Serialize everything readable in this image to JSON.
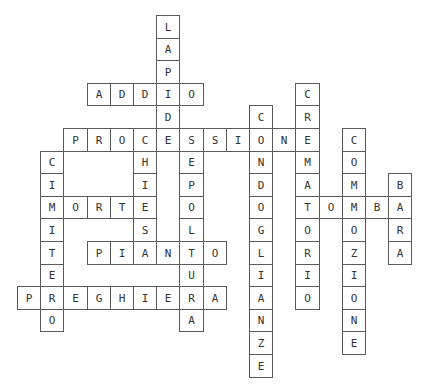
{
  "puzzle": {
    "type": "crossword",
    "grid": {
      "origin_x": 17,
      "origin_y": 15,
      "cell_w": 23.2,
      "cell_h": 22.6
    },
    "colors": {
      "border": "#5a5a5a",
      "text": "#333333",
      "background": "#ffffff"
    },
    "words": [
      {
        "word": "LAPIDE",
        "dir": "down",
        "col": 6,
        "row": 0
      },
      {
        "word": "ADDIO",
        "dir": "across",
        "col": 3,
        "row": 3
      },
      {
        "word": "CREMATORIO",
        "dir": "down",
        "col": 12,
        "row": 3
      },
      {
        "word": "CONDOGLIANZE",
        "dir": "down",
        "col": 10,
        "row": 4
      },
      {
        "word": "PROCESSIONE",
        "dir": "across",
        "col": 2,
        "row": 5
      },
      {
        "word": "CHIESA",
        "dir": "down",
        "col": 5,
        "row": 5
      },
      {
        "word": "SEPOLTURA",
        "dir": "down",
        "col": 7,
        "row": 5
      },
      {
        "word": "COMMOZIONE",
        "dir": "down",
        "col": 14,
        "row": 5
      },
      {
        "word": "CIMITERO",
        "dir": "down",
        "col": 1,
        "row": 6
      },
      {
        "word": "BARA",
        "dir": "down",
        "col": 16,
        "row": 7
      },
      {
        "word": "MORTE",
        "dir": "across",
        "col": 1,
        "row": 8
      },
      {
        "word": "TOMBA",
        "dir": "across",
        "col": 12,
        "row": 8
      },
      {
        "word": "PIANTO",
        "dir": "across",
        "col": 3,
        "row": 10
      },
      {
        "word": "PREGHIERA",
        "dir": "across",
        "col": 0,
        "row": 12
      }
    ]
  }
}
